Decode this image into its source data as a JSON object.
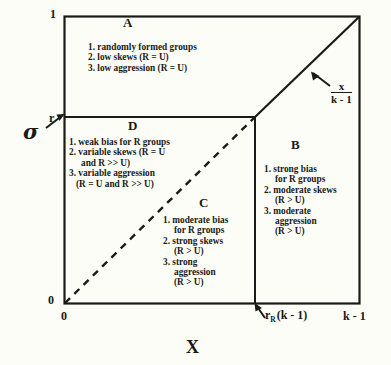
{
  "figure": {
    "type": "conceptual-phase-diagram",
    "axes": {
      "y_label": "σ",
      "y_ticks": [
        "1",
        "r",
        "0"
      ],
      "x_label": "X",
      "x_ticks": [
        "0",
        "r_R (k - 1)",
        "k - 1"
      ],
      "x_tick_rr_prefix": "r",
      "x_tick_rr_sub": "R",
      "x_tick_rr_suffix": "(k - 1)"
    },
    "annotation": {
      "numerator": "x",
      "denominator": "k - 1",
      "icon": "arrow-pointing-to-diagonal"
    },
    "regions": [
      {
        "id": "A",
        "label": "A",
        "items": [
          "1.  randomly formed groups",
          "2.  low skews (R = U)",
          "3.  low aggression (R = U)"
        ]
      },
      {
        "id": "D",
        "label": "D",
        "items": [
          "1. weak bias for R groups",
          "2. variable skews (R = U",
          "and R >> U)",
          "3. variable aggression",
          "(R = U and R >>  U)"
        ]
      },
      {
        "id": "C",
        "label": "C",
        "items": [
          "1. moderate bias",
          "for R groups",
          "2. strong skews",
          "(R > U)",
          "3. strong",
          "aggression",
          "(R > U)"
        ]
      },
      {
        "id": "B",
        "label": "B",
        "items": [
          "1. strong bias",
          "for R groups",
          "2. moderate skews",
          "(R > U)",
          "3. moderate",
          "aggression",
          "(R > U)"
        ]
      }
    ],
    "colors": {
      "ink": "#1a1a16",
      "background": "#fdfdf8"
    }
  }
}
